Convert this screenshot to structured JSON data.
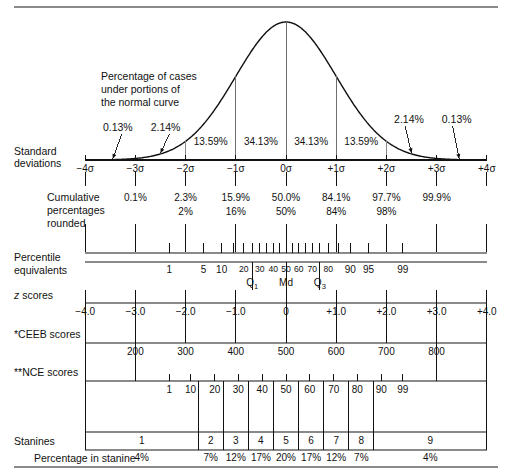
{
  "figure": {
    "axis": {
      "sigma_min": -4,
      "sigma_max": 4,
      "px_per_sigma": 50.2,
      "center_px": 286,
      "left_px": 85.2,
      "right_px": 486.8
    }
  },
  "curve_section": {
    "annotation_lines": [
      "Percentage of cases",
      "under portions of",
      "the normal curve"
    ],
    "band_percentages": [
      "0.13%",
      "2.14%",
      "13.59%",
      "34.13%",
      "34.13%",
      "13.59%",
      "2.14%",
      "0.13%"
    ],
    "band_centers_sigma": [
      -3.5,
      -2.5,
      -1.5,
      -0.5,
      0.5,
      1.5,
      2.5,
      3.5
    ],
    "outer_callouts": [
      {
        "text": "0.13%",
        "label_sigma": -3.35,
        "arrow_to_sigma": -3.45
      },
      {
        "text": "2.14%",
        "label_sigma": -2.4,
        "arrow_to_sigma": -2.5
      },
      {
        "text": "2.14%",
        "label_sigma": 2.45,
        "arrow_to_sigma": 2.5
      },
      {
        "text": "0.13%",
        "label_sigma": 3.4,
        "arrow_to_sigma": 3.45
      }
    ]
  },
  "rows": [
    {
      "id": "standard-deviations",
      "label_lines": [
        "Standard",
        "deviations"
      ],
      "tick_labels": [
        "−4σ",
        "−3σ",
        "−2σ",
        "−1σ",
        "0σ",
        "+1σ",
        "+2σ",
        "+3σ",
        "+4σ"
      ],
      "tick_sigmas": [
        -4,
        -3,
        -2,
        -1,
        0,
        1,
        2,
        3,
        4
      ]
    },
    {
      "id": "cumulative-percentages",
      "label_lines": [
        "Cumulative",
        "percentages",
        "rounded"
      ],
      "exact": [
        "0.1%",
        "2.3%",
        "15.9%",
        "50.0%",
        "84.1%",
        "97.7%",
        "99.9%"
      ],
      "exact_sigmas": [
        -3,
        -2,
        -1,
        0,
        1,
        2,
        3
      ],
      "rounded": [
        "2%",
        "16%",
        "50%",
        "84%",
        "98%"
      ],
      "rounded_sigmas": [
        -2,
        -1,
        0,
        1,
        2
      ]
    },
    {
      "id": "percentile-equivalents",
      "label_lines": [
        "Percentile",
        "equivalents"
      ],
      "tick_labels": [
        "1",
        "5",
        "10",
        "20",
        "30",
        "40",
        "50",
        "60",
        "70",
        "80",
        "90",
        "95",
        "99"
      ],
      "tick_sigmas": [
        -2.326,
        -1.645,
        -1.282,
        -0.842,
        -0.524,
        -0.253,
        0,
        0.253,
        0.524,
        0.842,
        1.282,
        1.645,
        2.326
      ],
      "minor_sigmas": [
        -2.326,
        -1.645,
        -1.282,
        -1.036,
        -0.842,
        -0.674,
        -0.524,
        -0.385,
        -0.253,
        -0.126,
        0,
        0.126,
        0.253,
        0.385,
        0.524,
        0.674,
        0.842,
        1.036,
        1.282,
        1.645,
        2.326
      ],
      "quartiles": [
        {
          "text": "Q",
          "sub": "1",
          "sigma": -0.674
        },
        {
          "text": "Md",
          "sub": "",
          "sigma": 0
        },
        {
          "text": "Q",
          "sub": "3",
          "sigma": 0.674
        }
      ]
    },
    {
      "id": "z-scores",
      "label_lines": [
        "z scores"
      ],
      "label_italic_first_char": true,
      "tick_labels": [
        "−4.0",
        "−3.0",
        "−2.0",
        "−1.0",
        "0",
        "+1.0",
        "+2.0",
        "+3.0",
        "+4.0"
      ],
      "tick_sigmas": [
        -4,
        -3,
        -2,
        -1,
        0,
        1,
        2,
        3,
        4
      ]
    },
    {
      "id": "ceeb-scores",
      "label_lines": [
        "*CEEB scores"
      ],
      "tick_labels": [
        "200",
        "300",
        "400",
        "500",
        "600",
        "700",
        "800"
      ],
      "tick_sigmas": [
        -3,
        -2,
        -1,
        0,
        1,
        2,
        3
      ],
      "end_ticks_sigmas": [
        -4,
        4
      ]
    },
    {
      "id": "nce-scores",
      "label_lines": [
        "**NCE scores"
      ],
      "tick_labels": [
        "1",
        "10",
        "20",
        "30",
        "40",
        "50",
        "60",
        "70",
        "80",
        "90",
        "99"
      ],
      "tick_sigmas": [
        -2.326,
        -1.9,
        -1.42,
        -0.95,
        -0.475,
        0,
        0.475,
        0.95,
        1.42,
        1.9,
        2.326
      ]
    },
    {
      "id": "stanines",
      "label_lines": [
        "Stanines"
      ],
      "cells": [
        {
          "label": "1",
          "pct": "4%",
          "from_sigma": -4,
          "to_sigma": -1.75
        },
        {
          "label": "2",
          "pct": "7%",
          "from_sigma": -1.75,
          "to_sigma": -1.25
        },
        {
          "label": "3",
          "pct": "12%",
          "from_sigma": -1.25,
          "to_sigma": -0.75
        },
        {
          "label": "4",
          "pct": "17%",
          "from_sigma": -0.75,
          "to_sigma": -0.25
        },
        {
          "label": "5",
          "pct": "20%",
          "from_sigma": -0.25,
          "to_sigma": 0.25
        },
        {
          "label": "6",
          "pct": "17%",
          "from_sigma": 0.25,
          "to_sigma": 0.75
        },
        {
          "label": "7",
          "pct": "12%",
          "from_sigma": 0.75,
          "to_sigma": 1.25
        },
        {
          "label": "8",
          "pct": "7%",
          "from_sigma": 1.25,
          "to_sigma": 1.75
        },
        {
          "label": "9",
          "pct": "4%",
          "from_sigma": 1.75,
          "to_sigma": 4
        }
      ],
      "pct_row_label": "Percentage in stanine"
    }
  ],
  "chart_data": {
    "type": "line",
    "xlabel": "Standard deviations",
    "ylabel": "",
    "xlim": [
      -4,
      4
    ],
    "grid": false,
    "legend": "none",
    "x": [
      -4,
      -3,
      -2,
      -1,
      0,
      1,
      2,
      3,
      4
    ],
    "distribution": "standard normal (gaussian) density",
    "area_under_segments_percent": [
      0.13,
      2.14,
      13.59,
      34.13,
      34.13,
      13.59,
      2.14,
      0.13
    ],
    "segment_bounds_sigma": [
      [
        -4,
        -3
      ],
      [
        -3,
        -2
      ],
      [
        -2,
        -1
      ],
      [
        -1,
        0
      ],
      [
        0,
        1
      ],
      [
        1,
        2
      ],
      [
        2,
        3
      ],
      [
        3,
        4
      ]
    ],
    "scales": [
      {
        "name": "Standard deviations",
        "ticks": [
          -4,
          -3,
          -2,
          -1,
          0,
          1,
          2,
          3,
          4
        ],
        "tick_labels": [
          "-4σ",
          "-3σ",
          "-2σ",
          "-1σ",
          "0σ",
          "+1σ",
          "+2σ",
          "+3σ",
          "+4σ"
        ]
      },
      {
        "name": "Cumulative percentages",
        "at_sigma": [
          -3,
          -2,
          -1,
          0,
          1,
          2,
          3
        ],
        "values": [
          "0.1%",
          "2.3%",
          "15.9%",
          "50.0%",
          "84.1%",
          "97.7%",
          "99.9%"
        ]
      },
      {
        "name": "Cumulative percentages rounded",
        "at_sigma": [
          -2,
          -1,
          0,
          1,
          2
        ],
        "values": [
          "2%",
          "16%",
          "50%",
          "84%",
          "98%"
        ]
      },
      {
        "name": "Percentile equivalents",
        "at_sigma": [
          -2.326,
          -1.645,
          -1.282,
          -0.842,
          -0.524,
          -0.253,
          0,
          0.253,
          0.524,
          0.842,
          1.282,
          1.645,
          2.326
        ],
        "values": [
          "1",
          "5",
          "10",
          "20",
          "30",
          "40",
          "50",
          "60",
          "70",
          "80",
          "90",
          "95",
          "99"
        ]
      },
      {
        "name": "z scores",
        "at_sigma": [
          -4,
          -3,
          -2,
          -1,
          0,
          1,
          2,
          3,
          4
        ],
        "values": [
          "-4.0",
          "-3.0",
          "-2.0",
          "-1.0",
          "0",
          "+1.0",
          "+2.0",
          "+3.0",
          "+4.0"
        ]
      },
      {
        "name": "CEEB scores",
        "at_sigma": [
          -3,
          -2,
          -1,
          0,
          1,
          2,
          3
        ],
        "values": [
          "200",
          "300",
          "400",
          "500",
          "600",
          "700",
          "800"
        ]
      },
      {
        "name": "NCE scores",
        "at_sigma": [
          -2.326,
          -1.9,
          -1.42,
          -0.95,
          -0.475,
          0,
          0.475,
          0.95,
          1.42,
          1.9,
          2.326
        ],
        "values": [
          "1",
          "10",
          "20",
          "30",
          "40",
          "50",
          "60",
          "70",
          "80",
          "90",
          "99"
        ]
      },
      {
        "name": "Stanines",
        "values": [
          "1",
          "2",
          "3",
          "4",
          "5",
          "6",
          "7",
          "8",
          "9"
        ],
        "percentages": [
          "4%",
          "7%",
          "12%",
          "17%",
          "20%",
          "17%",
          "12%",
          "7%",
          "4%"
        ]
      }
    ],
    "quartile_markers": [
      {
        "label": "Q1",
        "sigma": -0.674,
        "percentile": 25
      },
      {
        "label": "Md",
        "sigma": 0,
        "percentile": 50
      },
      {
        "label": "Q3",
        "sigma": 0.674,
        "percentile": 75
      }
    ]
  }
}
